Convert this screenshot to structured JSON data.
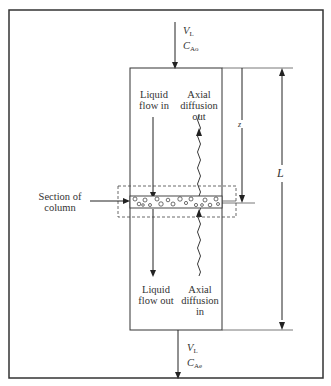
{
  "diagram": {
    "inlet": {
      "flow_symbol": "V",
      "flow_sub": "L",
      "conc_symbol": "C",
      "conc_sub": "Ao"
    },
    "outlet": {
      "flow_symbol": "V",
      "flow_sub": "L",
      "conc_symbol": "C",
      "conc_sub": "Ae"
    },
    "labels": {
      "liquid_flow_in": [
        "Liquid",
        "flow in"
      ],
      "axial_diffusion_out": [
        "Axial",
        "diffusion",
        "out"
      ],
      "liquid_flow_out": [
        "Liquid",
        "flow out"
      ],
      "axial_diffusion_in": [
        "Axial",
        "diffusion",
        "in"
      ],
      "section_of_column": [
        "Section of",
        "column"
      ],
      "z_dim": "z",
      "L_dim": "L"
    }
  }
}
